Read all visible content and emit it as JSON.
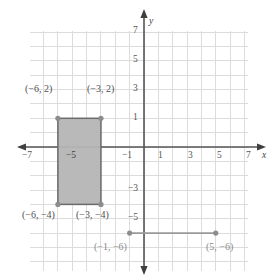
{
  "figure": {
    "kind": "coordinate-plane",
    "background_color": "#ffffff",
    "grid_color": "#d9d9d9",
    "axis_color": "#555555",
    "shape_fill": "#b5b5b5",
    "shape_stroke": "#6a6a6a",
    "segment_color": "#9a9a9a",
    "point_color": "#8c8c8c"
  },
  "axes": {
    "x_name": "x",
    "y_name": "y",
    "x_min": -8,
    "x_max": 8,
    "y_min": -8,
    "y_max": 8,
    "x_tick_labels": [
      "−7",
      "−5",
      "−3",
      "−1",
      "1",
      "3",
      "5",
      "7"
    ],
    "x_tick_values": [
      -7,
      -5,
      -3,
      -1,
      1,
      3,
      5,
      7
    ],
    "y_tick_labels": [
      "7",
      "5",
      "3",
      "1",
      "−3",
      "−5",
      "−7"
    ],
    "y_tick_values": [
      7,
      5,
      3,
      1,
      -3,
      -5,
      -7
    ]
  },
  "chart_data": {
    "type": "scatter",
    "title": "",
    "xlabel": "x",
    "ylabel": "y",
    "xlim": [
      -8,
      8
    ],
    "ylim": [
      -8,
      8
    ],
    "grid": true,
    "legend": "none",
    "rectangle": {
      "name": "shaded-rectangle",
      "vertices": [
        [
          -6,
          2
        ],
        [
          -3,
          2
        ],
        [
          -3,
          -4
        ],
        [
          -6,
          -4
        ]
      ],
      "width_units": 3,
      "height_units": 6,
      "fill": "#b5b5b5",
      "stroke": "#6a6a6a"
    },
    "segment": {
      "name": "horizontal-segment",
      "endpoints": [
        [
          -1,
          -6
        ],
        [
          5,
          -6
        ]
      ],
      "length_units": 6,
      "color": "#9a9a9a"
    },
    "points": [
      {
        "label": "(−6, 2)",
        "x": -6,
        "y": 2
      },
      {
        "label": "(−3, 2)",
        "x": -3,
        "y": 2
      },
      {
        "label": "(−6, −4)",
        "x": -6,
        "y": -4
      },
      {
        "label": "(−3, −4)",
        "x": -3,
        "y": -4
      },
      {
        "label": "(−1, −6)",
        "x": -1,
        "y": -6
      },
      {
        "label": "(5, −6)",
        "x": 5,
        "y": -6
      }
    ]
  },
  "point_labels": {
    "top_left": "(−6, 2)",
    "top_right": "(−3, 2)",
    "bottom_left": "(−6, −4)",
    "bottom_right": "(−3, −4)",
    "segment_left": "(−1, −6)",
    "segment_right": "(5, −6)"
  }
}
